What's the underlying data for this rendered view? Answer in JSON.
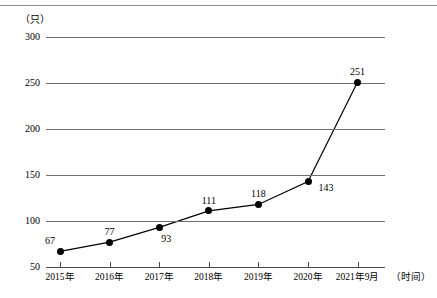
{
  "chart_data": {
    "type": "line",
    "title": "",
    "subtitle": "",
    "unit_label": "（只）",
    "xlabel": "（时间）",
    "ylabel": "",
    "categories": [
      "2015年",
      "2016年",
      "2017年",
      "2018年",
      "2019年",
      "2020年",
      "2021年9月"
    ],
    "values": [
      67,
      77,
      93,
      111,
      118,
      143,
      251
    ],
    "point_labels": [
      "67",
      "77",
      "93",
      "111",
      "118",
      "143",
      "251"
    ],
    "ylim": [
      50,
      300
    ],
    "yticks": [
      50,
      100,
      150,
      200,
      250,
      300
    ],
    "ytick_labels": [
      "50",
      "100",
      "150",
      "200",
      "250",
      "300"
    ],
    "grid": true,
    "legend": null,
    "legend_position": "none",
    "marker": "filled-circle",
    "line_color": "#000000",
    "marker_color": "#000000",
    "grid_color": "#6e6e6e"
  },
  "figure": {
    "background": "#ffffff",
    "top_rule_color": "#8c8c8c"
  }
}
